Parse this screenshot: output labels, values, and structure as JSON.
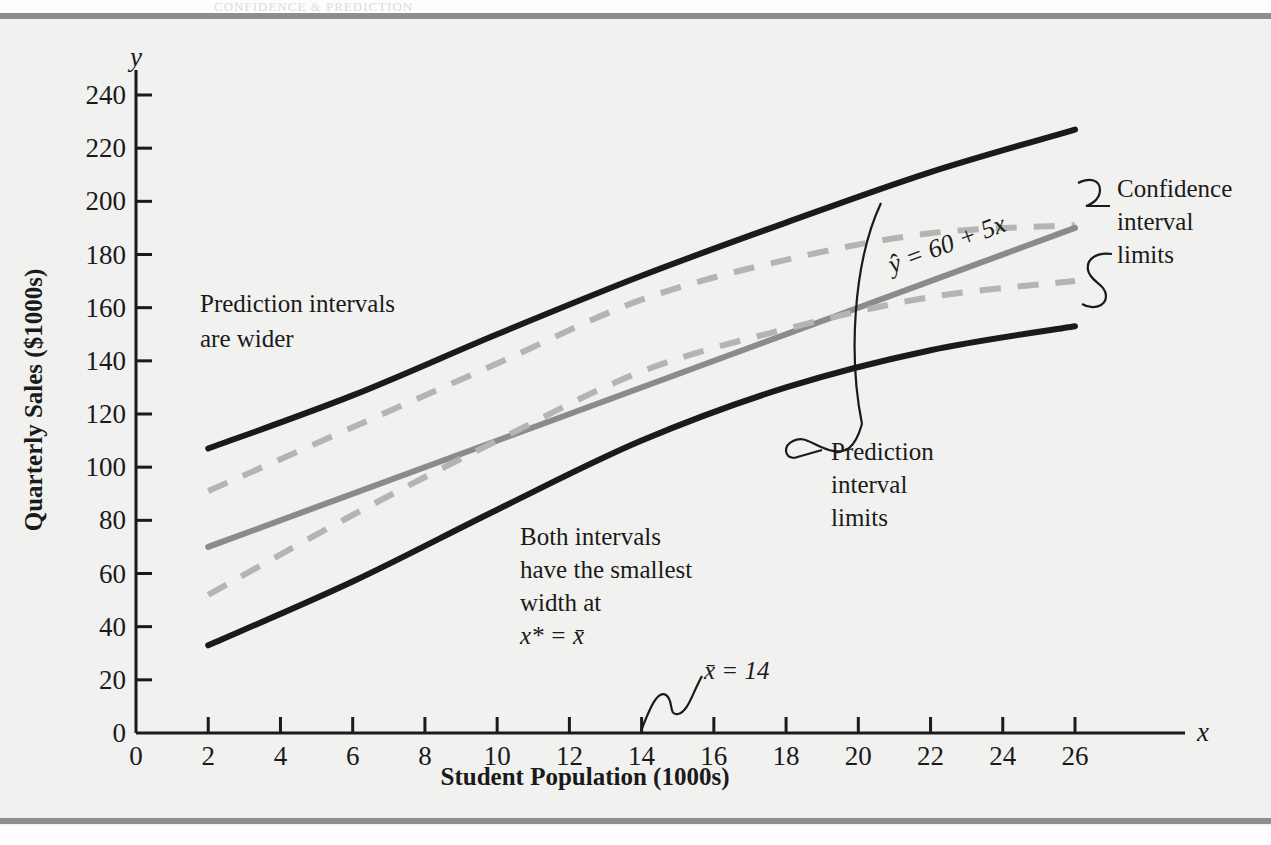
{
  "figure": {
    "background_color": "#f1f1ef",
    "rule_color": "#8e8e90"
  },
  "chart_data": {
    "type": "line",
    "title": "",
    "xlabel": "Student Population (1000s)",
    "ylabel": "Quarterly Sales ($1000s)",
    "x_axis_symbol": "x",
    "y_axis_symbol": "y",
    "xlim": [
      0,
      26
    ],
    "ylim": [
      0,
      240
    ],
    "xticks": [
      0,
      2,
      4,
      6,
      8,
      10,
      12,
      14,
      16,
      18,
      20,
      22,
      24,
      26
    ],
    "yticks": [
      0,
      20,
      40,
      60,
      80,
      100,
      120,
      140,
      160,
      180,
      200,
      220,
      240
    ],
    "grid": false,
    "legend": "none",
    "x_mean": 14,
    "regression_equation": "ŷ = 60 + 5x",
    "x_range_plotted": [
      2,
      26
    ],
    "series": [
      {
        "name": "Upper prediction interval limit",
        "style": "solid",
        "color": "#1a1a1a",
        "width": 5,
        "x": [
          2,
          6,
          10,
          14,
          18,
          22,
          26
        ],
        "y": [
          107,
          127,
          150,
          172,
          192,
          211,
          227
        ]
      },
      {
        "name": "Upper confidence interval limit",
        "style": "dashed",
        "color": "#b4b4b2",
        "width": 5,
        "x": [
          2,
          6,
          10,
          14,
          18,
          22,
          26
        ],
        "y": [
          91,
          115,
          139,
          163,
          178,
          188,
          191
        ]
      },
      {
        "name": "Estimated regression line",
        "style": "solid",
        "color": "#8b8b89",
        "width": 5,
        "x": [
          2,
          26
        ],
        "y": [
          70,
          190
        ]
      },
      {
        "name": "Lower confidence interval limit",
        "style": "dashed",
        "color": "#b4b4b2",
        "width": 5,
        "x": [
          2,
          6,
          10,
          14,
          18,
          22,
          26
        ],
        "y": [
          52,
          82,
          110,
          136,
          152,
          164,
          170
        ]
      },
      {
        "name": "Lower prediction interval limit",
        "style": "solid",
        "color": "#1a1a1a",
        "width": 5,
        "x": [
          2,
          6,
          10,
          14,
          18,
          22,
          26
        ],
        "y": [
          33,
          57,
          84,
          110,
          130,
          144,
          153
        ]
      }
    ],
    "annotations": [
      {
        "id": "prediction-intervals-wider",
        "lines": [
          "Prediction intervals",
          "are wider"
        ]
      },
      {
        "id": "both-intervals-smallest",
        "lines": [
          "Both intervals",
          "have the smallest",
          "width at",
          "x* = x̄"
        ]
      },
      {
        "id": "regression-equation",
        "text": "ŷ = 60 + 5x"
      },
      {
        "id": "confidence-interval-limits",
        "lines": [
          "Confidence",
          "interval",
          "limits"
        ]
      },
      {
        "id": "prediction-interval-limits",
        "lines": [
          "Prediction",
          "interval",
          "limits"
        ]
      },
      {
        "id": "x-bar",
        "text": "x̄ = 14"
      }
    ]
  },
  "annotations_text": {
    "pred_wider_1": "Prediction intervals",
    "pred_wider_2": "are wider",
    "both_1": "Both intervals",
    "both_2": "have the smallest",
    "both_3": "width at",
    "both_4": "x* = x̄",
    "eq": "ŷ = 60 + 5x",
    "ci_1": "Confidence",
    "ci_2": "interval",
    "ci_3": "limits",
    "pi_1": "Prediction",
    "pi_2": "interval",
    "pi_3": "limits",
    "xbar": "x̄ = 14"
  },
  "axis_labels": {
    "x_title": "Student Population (1000s)",
    "y_title": "Quarterly Sales ($1000s)",
    "x_symbol": "x",
    "y_symbol": "y",
    "xticks": [
      "0",
      "2",
      "4",
      "6",
      "8",
      "10",
      "12",
      "14",
      "16",
      "18",
      "20",
      "22",
      "24",
      "26"
    ],
    "yticks": [
      "0",
      "20",
      "40",
      "60",
      "80",
      "100",
      "120",
      "140",
      "160",
      "180",
      "200",
      "220",
      "240"
    ]
  }
}
